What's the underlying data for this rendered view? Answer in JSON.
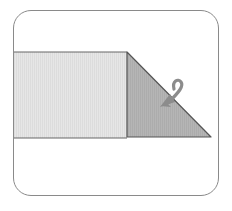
{
  "diagram": {
    "type": "origami-step",
    "colors": {
      "frame_border": "#8a8a8a",
      "paper_front": "#e4e4e4",
      "paper_folded": "#b3b3b3",
      "edge": "#555555",
      "arrow": "#8c8c8c"
    },
    "shapes": {
      "strip": {
        "x1": 13,
        "y1": 52,
        "x2": 127,
        "y2": 138
      },
      "folded_triangle": [
        [
          127,
          52
        ],
        [
          211,
          138
        ],
        [
          127,
          138
        ]
      ],
      "arrow": "fold-down-arrow"
    }
  }
}
